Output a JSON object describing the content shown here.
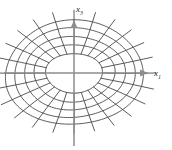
{
  "figure": {
    "background_color": "#ffffff",
    "mesh_color": "#4a4a4a",
    "axis_color": "#8c8c8c",
    "label_color": "#2b2b2b",
    "axes": {
      "horizontal": {
        "name": "x",
        "subscript": "1",
        "label": "x1",
        "direction": "right",
        "arrow": true
      },
      "vertical": {
        "name": "x",
        "subscript": "3",
        "label": "x3",
        "direction": "up",
        "arrow": true
      }
    }
  },
  "chart_data": {
    "type": "line",
    "title": "",
    "subtitle": "",
    "xlabel": "x1",
    "ylabel": "x3",
    "grid": true,
    "legend": "none",
    "center": [
      74,
      73
    ],
    "xlim": [
      -74,
      98
    ],
    "ylim": [
      -77,
      73
    ],
    "rings": {
      "count": 5,
      "semi_axis_x": [
        28,
        40,
        50,
        60,
        69
      ],
      "semi_axis_y": [
        20,
        29,
        37,
        45,
        52
      ],
      "note": "Innermost value is the central hole boundary; outer four are mesh rings."
    },
    "spokes": {
      "count": 24,
      "angles_deg": [
        0,
        15,
        30,
        45,
        60,
        75,
        90,
        105,
        120,
        135,
        150,
        165,
        180,
        195,
        210,
        225,
        240,
        255,
        270,
        285,
        300,
        315,
        330,
        345
      ],
      "inner_radius_factor": 1.0,
      "outer_radius_factor": 1.18
    }
  }
}
